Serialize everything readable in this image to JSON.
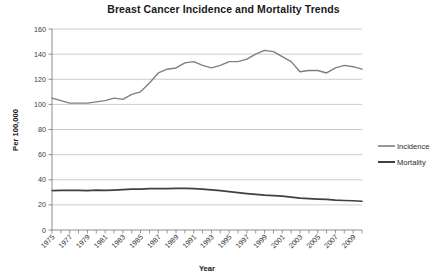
{
  "chart_data": {
    "type": "line",
    "title": "Breast Cancer Incidence and Mortality Trends",
    "xlabel": "Year",
    "ylabel": "Per 100,000",
    "ylim": [
      0,
      160
    ],
    "ytick_step": 20,
    "yticks": [
      "0",
      "20",
      "40",
      "60",
      "80",
      "100",
      "120",
      "140",
      "160"
    ],
    "xlim": [
      1975,
      2010
    ],
    "grid": "horizontal",
    "legend_position": "right",
    "x": [
      1975,
      1976,
      1977,
      1978,
      1979,
      1980,
      1981,
      1982,
      1983,
      1984,
      1985,
      1986,
      1987,
      1988,
      1989,
      1990,
      1991,
      1992,
      1993,
      1994,
      1995,
      1996,
      1997,
      1998,
      1999,
      2000,
      2001,
      2002,
      2003,
      2004,
      2005,
      2006,
      2007,
      2008,
      2009,
      2010
    ],
    "xtick_labels": [
      "1975",
      "1977",
      "1979",
      "1981",
      "1983",
      "1985",
      "1987",
      "1989",
      "1991",
      "1993",
      "1995",
      "1997",
      "1999",
      "2001",
      "2003",
      "2005",
      "2007",
      "2009"
    ],
    "series": [
      {
        "name": "Incidence",
        "color": "#7f7f7f",
        "values": [
          105,
          103,
          101,
          101,
          101,
          102,
          103,
          105,
          104,
          108,
          110,
          117,
          125,
          128,
          129,
          133,
          134,
          131,
          129,
          131,
          134,
          134,
          136,
          140,
          143,
          142,
          138,
          134,
          126,
          127,
          127,
          125,
          129,
          131,
          130,
          128
        ]
      },
      {
        "name": "Mortality",
        "color": "#404040",
        "values": [
          31.4,
          31.5,
          31.6,
          31.5,
          31.4,
          31.7,
          31.5,
          31.8,
          32.1,
          32.5,
          32.6,
          32.9,
          32.9,
          33.0,
          33.1,
          33.1,
          32.9,
          32.5,
          32.0,
          31.3,
          30.6,
          29.8,
          29.0,
          28.3,
          27.7,
          27.3,
          26.9,
          26.2,
          25.4,
          25.0,
          24.6,
          24.3,
          23.8,
          23.5,
          23.3,
          22.9
        ]
      }
    ]
  },
  "legend": {
    "items": [
      {
        "label": "Incidence"
      },
      {
        "label": "Mortality"
      }
    ]
  }
}
